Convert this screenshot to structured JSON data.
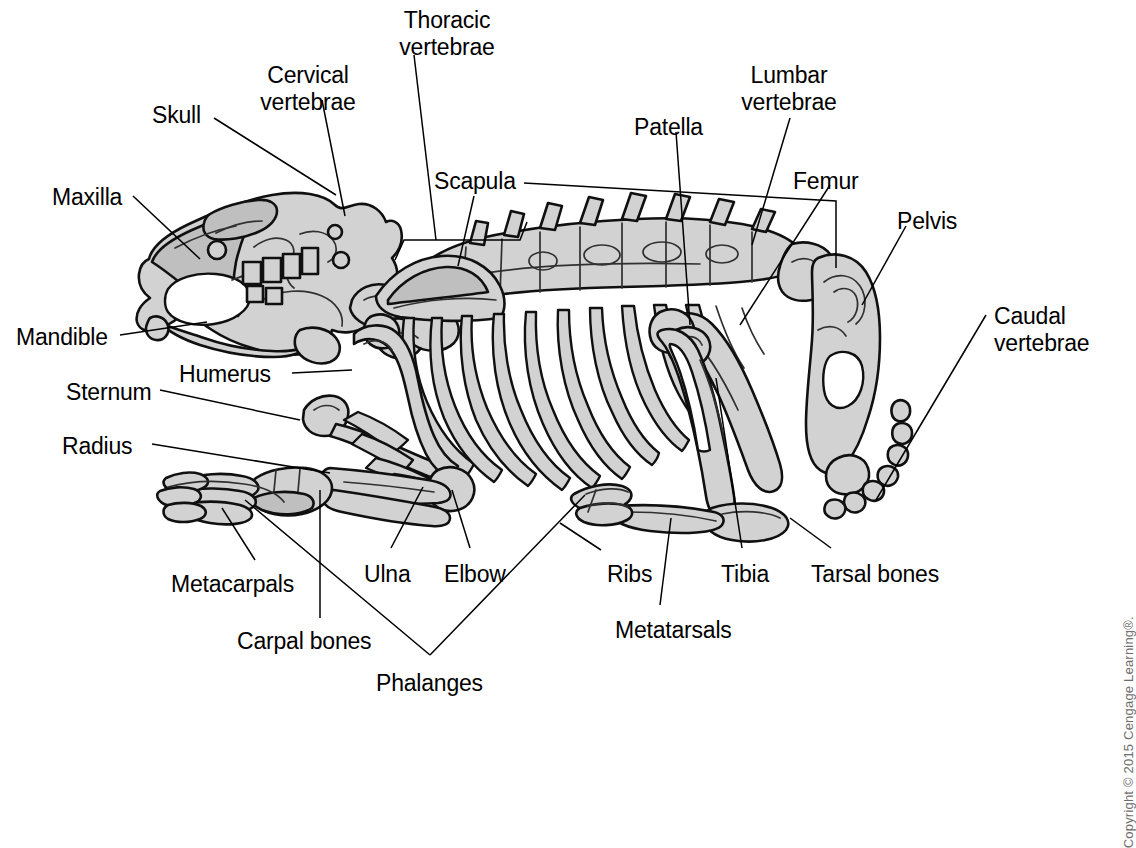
{
  "figure": {
    "background_color": "#ffffff",
    "bone_fill_color": "#d2d2d2",
    "outline_color": "#101010",
    "leader_line_color": "#000000"
  },
  "copyright": {
    "text": "Copyright © 2015 Cengage Learning®.",
    "color": "#6d6d6d",
    "orientation": "vertical-right-edge"
  },
  "labels": [
    {
      "id": "skull",
      "text": "Skull",
      "x": 152,
      "y": 102,
      "align": "left",
      "lines": 1
    },
    {
      "id": "cervical-vertebrae",
      "text": "Cervical\nvertebrae",
      "x": 308,
      "y": 62,
      "align": "center",
      "lines": 2
    },
    {
      "id": "thoracic-vertebrae",
      "text": "Thoracic\nvertebrae",
      "x": 447,
      "y": 7,
      "align": "center",
      "lines": 2
    },
    {
      "id": "maxilla",
      "text": "Maxilla",
      "x": 52,
      "y": 184,
      "align": "left",
      "lines": 1
    },
    {
      "id": "mandible",
      "text": "Mandible",
      "x": 16,
      "y": 324,
      "align": "left",
      "lines": 1
    },
    {
      "id": "scapula",
      "text": "Scapula",
      "x": 434,
      "y": 168,
      "align": "left",
      "lines": 1
    },
    {
      "id": "patella",
      "text": "Patella",
      "x": 634,
      "y": 114,
      "align": "left",
      "lines": 1
    },
    {
      "id": "lumbar-vertebrae",
      "text": "Lumbar\nvertebrae",
      "x": 789,
      "y": 62,
      "align": "center",
      "lines": 2
    },
    {
      "id": "femur",
      "text": "Femur",
      "x": 793,
      "y": 168,
      "align": "left",
      "lines": 1
    },
    {
      "id": "pelvis",
      "text": "Pelvis",
      "x": 897,
      "y": 208,
      "align": "left",
      "lines": 1
    },
    {
      "id": "caudal-vertebrae",
      "text": "Caudal\nvertebrae",
      "x": 994,
      "y": 303,
      "align": "left",
      "lines": 2
    },
    {
      "id": "humerus",
      "text": "Humerus",
      "x": 179,
      "y": 361,
      "align": "left",
      "lines": 1
    },
    {
      "id": "sternum",
      "text": "Sternum",
      "x": 66,
      "y": 379,
      "align": "left",
      "lines": 1
    },
    {
      "id": "radius",
      "text": "Radius",
      "x": 62,
      "y": 433,
      "align": "left",
      "lines": 1
    },
    {
      "id": "metacarpals",
      "text": "Metacarpals",
      "x": 171,
      "y": 571,
      "align": "left",
      "lines": 1
    },
    {
      "id": "carpal-bones",
      "text": "Carpal bones",
      "x": 237,
      "y": 628,
      "align": "left",
      "lines": 1
    },
    {
      "id": "phalanges",
      "text": "Phalanges",
      "x": 376,
      "y": 670,
      "align": "left",
      "lines": 1
    },
    {
      "id": "ulna",
      "text": "Ulna",
      "x": 364,
      "y": 561,
      "align": "left",
      "lines": 1
    },
    {
      "id": "elbow",
      "text": "Elbow",
      "x": 444,
      "y": 561,
      "align": "left",
      "lines": 1
    },
    {
      "id": "ribs",
      "text": "Ribs",
      "x": 607,
      "y": 561,
      "align": "left",
      "lines": 1
    },
    {
      "id": "tibia",
      "text": "Tibia",
      "x": 721,
      "y": 561,
      "align": "left",
      "lines": 1
    },
    {
      "id": "tarsal-bones",
      "text": "Tarsal bones",
      "x": 811,
      "y": 561,
      "align": "left",
      "lines": 1
    },
    {
      "id": "metatarsals",
      "text": "Metatarsals",
      "x": 615,
      "y": 617,
      "align": "left",
      "lines": 1
    }
  ],
  "leader_lines": [
    {
      "for": "skull",
      "path": "M 214 118 L 336 195"
    },
    {
      "for": "cervical-vertebrae",
      "path": "M 322 100 L 345 216"
    },
    {
      "for": "thoracic-vertebrae",
      "path": "M 414 55 L 436 240"
    },
    {
      "for": "maxilla",
      "path": "M 133 196 L 200 259"
    },
    {
      "for": "mandible",
      "path": "M 120 335 L 207 322"
    },
    {
      "for": "scapula",
      "path": "M 474 196 L 458 266"
    },
    {
      "for": "patella",
      "path": "M 676 132 L 690 325"
    },
    {
      "for": "lumbar-vertebrae",
      "path": "M 790 118 L 752 245"
    },
    {
      "for": "femur",
      "path": "M 830 185 L 740 325"
    },
    {
      "for": "pelvis",
      "path": "M 906 226 L 862 305"
    },
    {
      "for": "caudal-vertebrae",
      "path": "M 986 315 L 876 500"
    },
    {
      "for": "humerus",
      "path": "M 292 373 L 352 370"
    },
    {
      "for": "sternum",
      "path": "M 160 390 L 300 420"
    },
    {
      "for": "radius",
      "path": "M 152 444 L 330 473"
    },
    {
      "for": "metacarpals",
      "path": "M 255 560 L 222 508"
    },
    {
      "for": "carpal-bones",
      "path": "M 320 618 L 320 490"
    },
    {
      "for": "ulna",
      "path": "M 391 548 L 423 487"
    },
    {
      "for": "elbow",
      "path": "M 470 548 L 452 490"
    },
    {
      "for": "ribs",
      "path": "M 601 550 L 560 523"
    },
    {
      "for": "tibia",
      "path": "M 742 548 L 716 378"
    },
    {
      "for": "tarsal-bones",
      "path": "M 831 548 L 790 518"
    },
    {
      "for": "metatarsals",
      "path": "M 660 605 L 671 518"
    }
  ],
  "leader_brackets": [
    {
      "for": "thoracic-vertebrae-scapula",
      "path": "M 395 260 L 404 240 L 520 240 L 527 222"
    },
    {
      "for": "lumbar-vertebrae-span",
      "path": "M 524 183 L 836 201 L 836 268"
    },
    {
      "for": "phalanges-fork",
      "path": "M 430 655 L 245 500 M 430 655 L 585 495"
    }
  ]
}
